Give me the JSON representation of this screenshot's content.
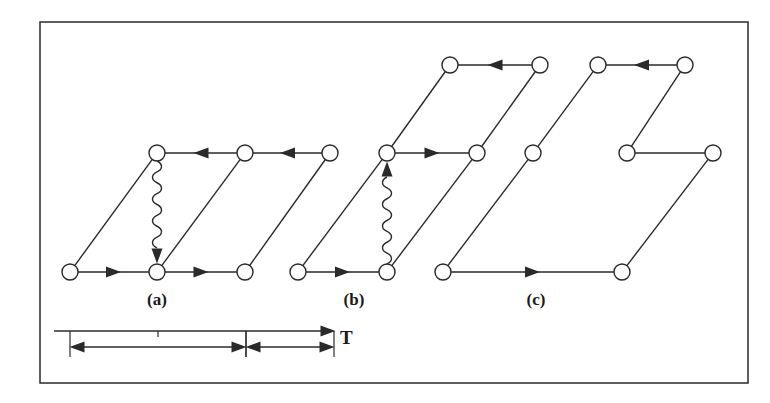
{
  "figure": {
    "colors": {
      "stroke": "#2a2a2a",
      "node_fill": "#ffffff",
      "background": "#ffffff"
    },
    "frame": {
      "x": 40,
      "y": 22,
      "width": 708,
      "height": 361
    },
    "panels": [
      {
        "label": "(a)",
        "label_pos": {
          "x": 157,
          "y": 290
        },
        "nodes": [
          {
            "id": "a1",
            "x": 70,
            "y": 272
          },
          {
            "id": "a2",
            "x": 157,
            "y": 272
          },
          {
            "id": "a3",
            "x": 245,
            "y": 272
          },
          {
            "id": "a4",
            "x": 157,
            "y": 153
          },
          {
            "id": "a5",
            "x": 245,
            "y": 153
          },
          {
            "id": "a6",
            "x": 330,
            "y": 153
          }
        ],
        "edges": [
          {
            "from": "a1",
            "to": "a2",
            "type": "arrow"
          },
          {
            "from": "a2",
            "to": "a3",
            "type": "arrow"
          },
          {
            "from": "a5",
            "to": "a4",
            "type": "arrow"
          },
          {
            "from": "a6",
            "to": "a5",
            "type": "arrow"
          },
          {
            "from": "a1",
            "to": "a4",
            "type": "line"
          },
          {
            "from": "a2",
            "to": "a5",
            "type": "line"
          },
          {
            "from": "a3",
            "to": "a6",
            "type": "line"
          },
          {
            "from": "a4",
            "to": "a2",
            "type": "wavy-arrow"
          }
        ]
      },
      {
        "label": "(b)",
        "label_pos": {
          "x": 354,
          "y": 290
        },
        "nodes": [
          {
            "id": "b1",
            "x": 298,
            "y": 272
          },
          {
            "id": "b2",
            "x": 387,
            "y": 272
          },
          {
            "id": "b3",
            "x": 387,
            "y": 153
          },
          {
            "id": "b4",
            "x": 477,
            "y": 153
          },
          {
            "id": "b5",
            "x": 450,
            "y": 65
          },
          {
            "id": "b6",
            "x": 540,
            "y": 65
          }
        ],
        "edges": [
          {
            "from": "b1",
            "to": "b2",
            "type": "arrow"
          },
          {
            "from": "b3",
            "to": "b4",
            "type": "arrow"
          },
          {
            "from": "b6",
            "to": "b5",
            "type": "arrow"
          },
          {
            "from": "b1",
            "to": "b3",
            "type": "line"
          },
          {
            "from": "b3",
            "to": "b5",
            "type": "line"
          },
          {
            "from": "b2",
            "to": "b4",
            "type": "line"
          },
          {
            "from": "b4",
            "to": "b6",
            "type": "line"
          },
          {
            "from": "b2",
            "to": "b3",
            "type": "wavy-arrow"
          }
        ]
      },
      {
        "label": "(c)",
        "label_pos": {
          "x": 536,
          "y": 290
        },
        "nodes": [
          {
            "id": "c1",
            "x": 443,
            "y": 272
          },
          {
            "id": "c2",
            "x": 622,
            "y": 272
          },
          {
            "id": "c3",
            "x": 533,
            "y": 153
          },
          {
            "id": "c4",
            "x": 627,
            "y": 153
          },
          {
            "id": "c5",
            "x": 713,
            "y": 153
          },
          {
            "id": "c6",
            "x": 598,
            "y": 65
          },
          {
            "id": "c7",
            "x": 685,
            "y": 65
          }
        ],
        "edges": [
          {
            "from": "c1",
            "to": "c2",
            "type": "arrow"
          },
          {
            "from": "c7",
            "to": "c6",
            "type": "arrow"
          },
          {
            "from": "c4",
            "to": "c5",
            "type": "line"
          },
          {
            "from": "c1",
            "to": "c3",
            "type": "line"
          },
          {
            "from": "c3",
            "to": "c6",
            "type": "line"
          },
          {
            "from": "c2",
            "to": "c5",
            "type": "line"
          },
          {
            "from": "c4",
            "to": "c7",
            "type": "line"
          }
        ]
      }
    ],
    "time_axis": {
      "label": "T",
      "label_pos": {
        "x": 340,
        "y": 327
      },
      "axis": {
        "x1": 54,
        "x2": 335,
        "y": 331
      },
      "tick": {
        "x": 158,
        "y1": 331,
        "y2": 337
      },
      "intervals": [
        {
          "x1": 70,
          "x2": 246,
          "y": 347,
          "bar_top": 331,
          "bar_bottom": 357
        },
        {
          "x1": 246,
          "x2": 334,
          "y": 347,
          "bar_top": 331,
          "bar_bottom": 357
        }
      ]
    }
  }
}
